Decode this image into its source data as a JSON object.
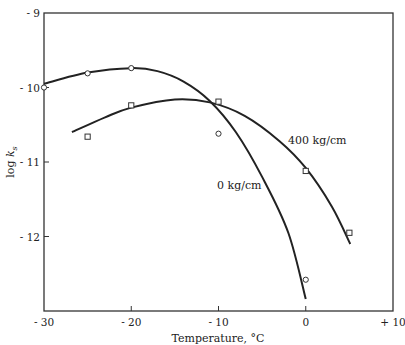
{
  "chart_data": {
    "type": "line",
    "title": "",
    "xlabel": "Temperature, °C",
    "ylabel": "log k_s",
    "ylabel_parts": {
      "prefix": "log ",
      "var": "k",
      "sub": "s"
    },
    "xlim": [
      -30,
      10
    ],
    "ylim": [
      -13,
      -9
    ],
    "x_ticks": [
      -30,
      -20,
      -10,
      0,
      10
    ],
    "x_tick_labels": [
      "- 30",
      "- 20",
      "- 10",
      "0",
      "+ 10"
    ],
    "y_ticks": [
      -9,
      -10,
      -11,
      -12
    ],
    "y_tick_labels": [
      "- 9",
      "- 10",
      "- 11",
      "- 12"
    ],
    "grid": false,
    "legend": "inline labels on curves",
    "series": [
      {
        "name": "0 kg/cm",
        "label": "0 kg/cm",
        "marker": "circle",
        "points": [
          {
            "x": -30,
            "y": -10.0
          },
          {
            "x": -25,
            "y": -9.81
          },
          {
            "x": -20,
            "y": -9.74
          },
          {
            "x": -10,
            "y": -10.62
          },
          {
            "x": 0,
            "y": -12.58
          }
        ],
        "fit_curve": [
          {
            "x": -30,
            "y": -9.95
          },
          {
            "x": -25,
            "y": -9.8
          },
          {
            "x": -20,
            "y": -9.74
          },
          {
            "x": -17,
            "y": -9.78
          },
          {
            "x": -14,
            "y": -9.92
          },
          {
            "x": -11,
            "y": -10.18
          },
          {
            "x": -8,
            "y": -10.6
          },
          {
            "x": -5,
            "y": -11.2
          },
          {
            "x": -2,
            "y": -11.95
          },
          {
            "x": 0,
            "y": -12.84
          }
        ]
      },
      {
        "name": "400 kg/cm",
        "label": "400 kg/cm",
        "marker": "square",
        "points": [
          {
            "x": -25,
            "y": -10.66
          },
          {
            "x": -20,
            "y": -10.24
          },
          {
            "x": -10,
            "y": -10.19
          },
          {
            "x": 0,
            "y": -11.12
          },
          {
            "x": 5,
            "y": -11.95
          }
        ],
        "fit_curve": [
          {
            "x": -26.8,
            "y": -10.6
          },
          {
            "x": -23,
            "y": -10.4
          },
          {
            "x": -20,
            "y": -10.27
          },
          {
            "x": -15,
            "y": -10.16
          },
          {
            "x": -11,
            "y": -10.2
          },
          {
            "x": -7,
            "y": -10.38
          },
          {
            "x": -3,
            "y": -10.72
          },
          {
            "x": 0,
            "y": -11.08
          },
          {
            "x": 3,
            "y": -11.6
          },
          {
            "x": 5.1,
            "y": -12.1
          }
        ]
      }
    ]
  }
}
